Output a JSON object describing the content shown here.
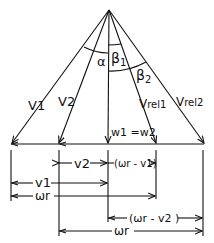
{
  "diagram": {
    "type": "velocity triangle (turbomachine blade)",
    "vectors": {
      "v1": "V1",
      "v2": "V2",
      "w": "w1 =w2",
      "vrel1_main": "V",
      "vrel1_sub": "rel1",
      "vrel2_main": "V",
      "vrel2_sub": "rel2"
    },
    "angles": {
      "alpha": "α",
      "beta1": "β",
      "beta1_sub": "1",
      "beta2": "β",
      "beta2_sub": "2"
    },
    "dimensions": {
      "v2": "v2",
      "wr_minus_v1": "(ωr - v1)",
      "v1": "v1",
      "wr_1": "ωr",
      "wr_minus_v2": "(ωr - v2 )",
      "wr_2": "ωr"
    }
  }
}
